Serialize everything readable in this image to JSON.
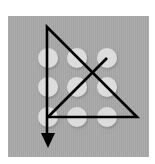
{
  "diagram": {
    "grid": {
      "rows": 3,
      "cols": 3,
      "dot_color": "#dcdcdc",
      "background_color": "#a8a8a8",
      "line_color": "#000000"
    },
    "dots": [
      {
        "id": "dot-1",
        "row": 1,
        "col": 1,
        "cx": 48,
        "cy": 58
      },
      {
        "id": "dot-2",
        "row": 1,
        "col": 2,
        "cx": 77,
        "cy": 58
      },
      {
        "id": "dot-3",
        "row": 1,
        "col": 3,
        "cx": 107,
        "cy": 58
      },
      {
        "id": "dot-4",
        "row": 2,
        "col": 1,
        "cx": 48,
        "cy": 87
      },
      {
        "id": "dot-5",
        "row": 2,
        "col": 2,
        "cx": 77,
        "cy": 87
      },
      {
        "id": "dot-6",
        "row": 2,
        "col": 3,
        "cx": 107,
        "cy": 87
      },
      {
        "id": "dot-7",
        "row": 3,
        "col": 1,
        "cx": 48,
        "cy": 117
      },
      {
        "id": "dot-8",
        "row": 3,
        "col": 2,
        "cx": 77,
        "cy": 117
      },
      {
        "id": "dot-9",
        "row": 3,
        "col": 3,
        "cx": 107,
        "cy": 117
      }
    ],
    "strokes": [
      {
        "name": "diagonal-stroke-to-top-right-dot",
        "from": [
          48,
          117
        ],
        "to": [
          107,
          58
        ]
      },
      {
        "name": "bottom-horizontal-stroke",
        "from": [
          48,
          117
        ],
        "to": [
          137,
          117
        ]
      },
      {
        "name": "long-diagonal-stroke",
        "from": [
          137,
          117
        ],
        "to": [
          47,
          27
        ]
      },
      {
        "name": "vertical-stroke-with-arrow",
        "from": [
          47,
          27
        ],
        "to": [
          47,
          146
        ]
      }
    ],
    "arrow": {
      "direction": "down",
      "tip": [
        48,
        148
      ]
    }
  }
}
